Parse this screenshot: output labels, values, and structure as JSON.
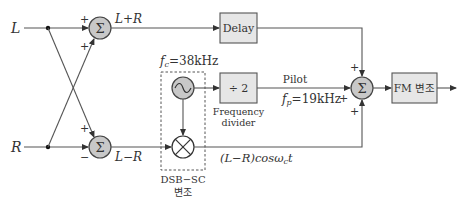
{
  "diagram": {
    "inputs": {
      "left": "L",
      "right": "R"
    },
    "sum_top": {
      "symbol": "Σ",
      "sign_a": "+",
      "sign_b": "+",
      "output_label": "L+R"
    },
    "sum_bottom": {
      "symbol": "Σ",
      "sign_a": "+",
      "sign_b": "−",
      "output_label": "L−R"
    },
    "delay": {
      "label": "Delay"
    },
    "oscillator": {
      "freq_label_f": "f",
      "freq_label_sub": "c",
      "freq_label_val": "=38kHz"
    },
    "divider": {
      "label": "÷ 2",
      "caption_line1": "Frequency",
      "caption_line2": "divider"
    },
    "pilot": {
      "label": "Pilot",
      "freq_f": "f",
      "freq_sub": "p",
      "freq_val": "=19kHz"
    },
    "modulator_group": {
      "caption_line1": "DSB−SC",
      "caption_line2": "변조"
    },
    "mod_output": {
      "label_main": "(L−R)cosω",
      "label_sub": "c",
      "label_t": "t"
    },
    "sum_out": {
      "symbol": "Σ",
      "sign_top": "+",
      "sign_left": "+",
      "sign_bottom": "+"
    },
    "fm": {
      "label": "FM 변조"
    }
  }
}
